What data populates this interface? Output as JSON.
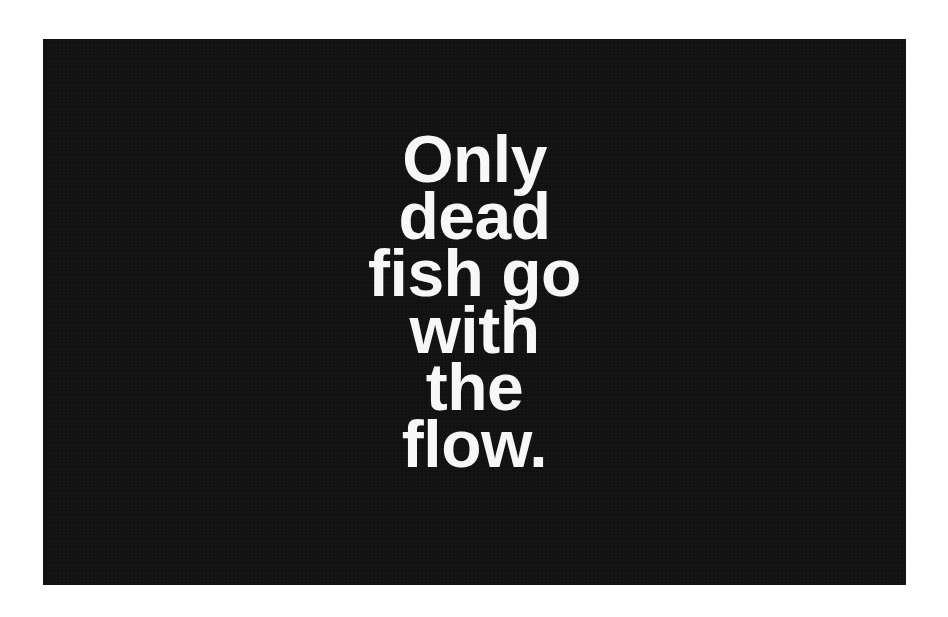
{
  "poster": {
    "background_color": "#131313",
    "text_color": "#f7f7f7",
    "quote_lines": [
      "Only",
      "dead",
      "fish go",
      "with",
      "the",
      "flow."
    ]
  }
}
